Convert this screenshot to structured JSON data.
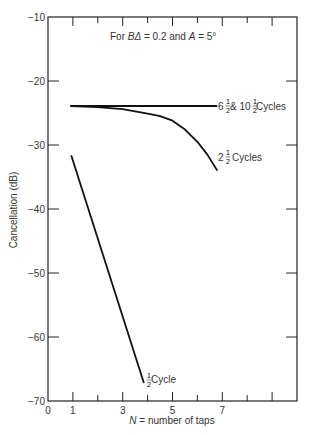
{
  "chart_data": {
    "type": "line",
    "title": "",
    "annotation": "For BΔ = 0.2 and A = 5°",
    "annotation_parts": {
      "prefix": "For ",
      "bd": "BΔ",
      "mid": " = 0.2 and ",
      "a": "A",
      "suffix": " = 5°"
    },
    "xlabel": "N = number of taps",
    "xlabel_parts": {
      "n": "N",
      "rest": " = number of taps"
    },
    "ylabel": "Cancellation (dB)",
    "xlim": [
      0,
      10
    ],
    "ylim": [
      -70,
      -10
    ],
    "x_tick_labels": [
      "0",
      "1",
      "3",
      "5",
      "7"
    ],
    "x_tick_values": [
      0,
      1,
      3,
      5,
      7
    ],
    "x_minor_ticks": [
      1,
      2,
      3,
      4,
      5,
      6,
      7,
      8,
      9
    ],
    "y_tick_labels": [
      "-10",
      "-20",
      "-30",
      "-40",
      "-50",
      "-60",
      "-70"
    ],
    "y_tick_values": [
      -10,
      -20,
      -30,
      -40,
      -50,
      -60,
      -70
    ],
    "grid": false,
    "legend": "inline labels",
    "series": [
      {
        "name": "6½ & 10½ Cycles",
        "label_parts": {
          "a": "6",
          "b": " & 10",
          "c": " Cycles"
        },
        "x": [
          0.9,
          2,
          3,
          4,
          5,
          6,
          6.8
        ],
        "y": [
          -23.9,
          -23.9,
          -23.9,
          -23.9,
          -23.9,
          -23.9,
          -23.9
        ]
      },
      {
        "name": "2½ Cycles",
        "label_parts": {
          "a": "2",
          "c": " Cycles"
        },
        "x": [
          0.9,
          2,
          3,
          4,
          4.5,
          5,
          5.5,
          6,
          6.4,
          6.8
        ],
        "y": [
          -23.9,
          -24.1,
          -24.4,
          -25.1,
          -25.5,
          -26.2,
          -27.6,
          -29.5,
          -31.5,
          -34.0
        ]
      },
      {
        "name": "½ Cycle",
        "label_parts": {
          "c": " Cycle"
        },
        "x": [
          0.93,
          3.85
        ],
        "y": [
          -31.6,
          -67.2
        ]
      }
    ]
  }
}
